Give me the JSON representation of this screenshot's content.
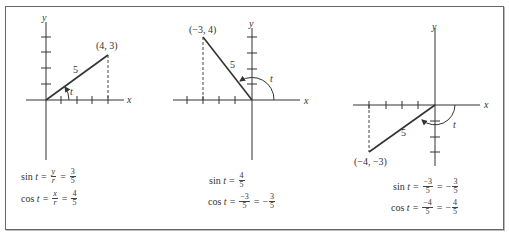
{
  "panels": [
    {
      "id": "quadrant-1",
      "axis_labels": {
        "x": "x",
        "y": "y"
      },
      "point_label": "(4, 3)",
      "point": [
        4,
        3
      ],
      "hypotenuse_label": "5",
      "angle_label": "t",
      "equations": {
        "sin": {
          "lhs": "sin",
          "var": "t",
          "mid_num": "y",
          "mid_den": "r",
          "num": "3",
          "den": "5",
          "sign": ""
        },
        "cos": {
          "lhs": "cos",
          "var": "t",
          "mid_num": "x",
          "mid_den": "r",
          "num": "4",
          "den": "5",
          "sign": ""
        }
      }
    },
    {
      "id": "quadrant-2",
      "axis_labels": {
        "x": "x",
        "y": "y"
      },
      "point_label": "(−3, 4)",
      "point": [
        -3,
        4
      ],
      "hypotenuse_label": "5",
      "angle_label": "t",
      "equations": {
        "sin": {
          "lhs": "sin",
          "var": "t",
          "num": "4",
          "den": "5"
        },
        "cos": {
          "lhs": "cos",
          "var": "t",
          "mid_num": "−3",
          "mid_den": "5",
          "sign": "−",
          "num": "3",
          "den": "5"
        }
      }
    },
    {
      "id": "quadrant-3",
      "axis_labels": {
        "x": "x",
        "y": "y"
      },
      "point_label": "(−4, −3)",
      "point": [
        -4,
        -3
      ],
      "hypotenuse_label": "5",
      "angle_label": "t",
      "equations": {
        "sin": {
          "lhs": "sin",
          "var": "t",
          "mid_num": "−3",
          "mid_den": "5",
          "sign": "−",
          "num": "3",
          "den": "5"
        },
        "cos": {
          "lhs": "cos",
          "var": "t",
          "mid_num": "−4",
          "mid_den": "5",
          "sign": "−",
          "num": "4",
          "den": "5"
        }
      }
    }
  ],
  "symbols": {
    "equals": "="
  },
  "colors": {
    "line": "#333333",
    "frame": "#666666",
    "background": "#ffffff"
  }
}
